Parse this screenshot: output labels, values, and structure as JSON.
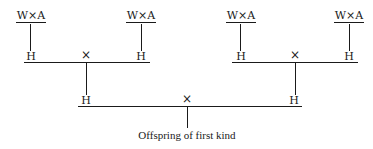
{
  "diagram": {
    "type": "breeding-cross-tree",
    "parents": [
      {
        "label": "W×A"
      },
      {
        "label": "W×A"
      },
      {
        "label": "W×A"
      },
      {
        "label": "W×A"
      }
    ],
    "first_hybrids": [
      {
        "label": "H"
      },
      {
        "label": "H"
      },
      {
        "label": "H"
      },
      {
        "label": "H"
      }
    ],
    "first_crosses": [
      {
        "symbol": "×"
      },
      {
        "symbol": "×"
      }
    ],
    "second_hybrids": [
      {
        "label": "H"
      },
      {
        "label": "H"
      }
    ],
    "final_cross": {
      "symbol": "×"
    },
    "result": {
      "label": "Offspring of first kind"
    },
    "colors": {
      "ink": "#1a1a1a",
      "background": "#ffffff"
    }
  }
}
